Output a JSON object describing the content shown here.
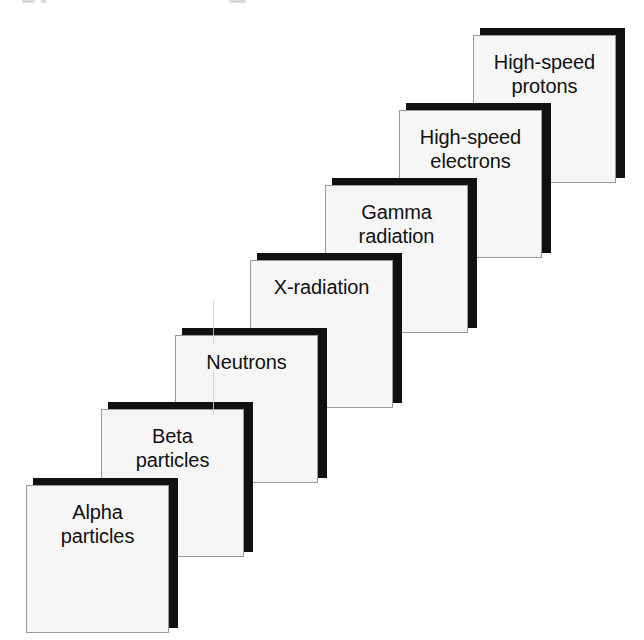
{
  "diagram": {
    "type": "staircase",
    "step_count": 7,
    "colors": {
      "background": "#ffffff",
      "box_fill": "#f6f6f6",
      "box_border": "#9a9a9a",
      "box_shadow": "#111111",
      "text": "#111111"
    },
    "steps": [
      {
        "order": 1,
        "name": "alpha-particles",
        "label": "Alpha\nparticles",
        "line1": "Alpha",
        "line2": "particles",
        "x": 26,
        "y": 478
      },
      {
        "order": 2,
        "name": "beta-particles",
        "label": "Beta\nparticles",
        "line1": "Beta",
        "line2": "particles",
        "x": 101,
        "y": 402
      },
      {
        "order": 3,
        "name": "neutrons",
        "label": "Neutrons",
        "line1": "Neutrons",
        "line2": "",
        "x": 175,
        "y": 328
      },
      {
        "order": 4,
        "name": "x-radiation",
        "label": "X-radiation",
        "line1": "X-radiation",
        "line2": "",
        "x": 250,
        "y": 253
      },
      {
        "order": 5,
        "name": "gamma-radiation",
        "label": "Gamma\nradiation",
        "line1": "Gamma",
        "line2": "radiation",
        "x": 325,
        "y": 178
      },
      {
        "order": 6,
        "name": "high-speed-electrons",
        "label": "High-speed\nelectrons",
        "line1": "High-speed",
        "line2": "electrons",
        "x": 399,
        "y": 103
      },
      {
        "order": 7,
        "name": "high-speed-protons",
        "label": "High-speed\nprotons",
        "line1": "High-speed",
        "line2": "protons",
        "x": 473,
        "y": 28
      }
    ]
  }
}
